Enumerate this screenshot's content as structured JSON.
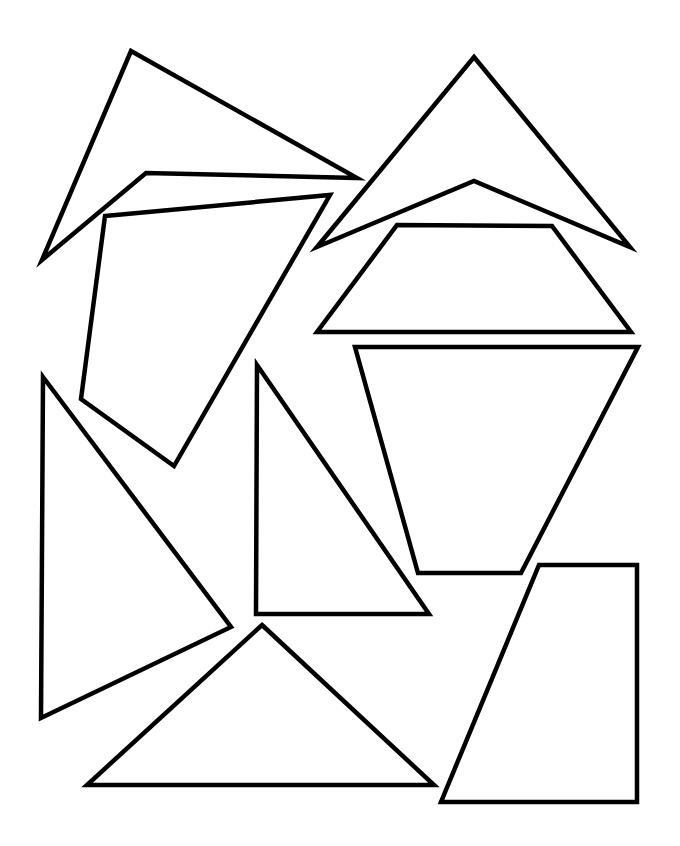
{
  "canvas": {
    "width": 680,
    "height": 846,
    "background": "#ffffff",
    "stroke_color": "#000000",
    "stroke_width": 4.5
  },
  "shapes": [
    {
      "name": "concave-kite-top-left",
      "points": "131,51 357,178 146,173 42,260"
    },
    {
      "name": "concave-kite-top-right",
      "points": "474,57 630,247 474,181 317,247"
    },
    {
      "name": "trapezoid-upper-right",
      "points": "397,225 552,226 631,332 317,332"
    },
    {
      "name": "quadrilateral-left",
      "points": "105,216 330,195 174,466 81,399"
    },
    {
      "name": "inverted-trapezoid-right",
      "points": "355,347 638,347 521,573 418,573"
    },
    {
      "name": "triangle-tall-left",
      "points": "43,377 231,627 41,718"
    },
    {
      "name": "right-triangle-center",
      "points": "257,365 429,614 256,614"
    },
    {
      "name": "triangle-bottom",
      "points": "262,625 434,785 87,785"
    },
    {
      "name": "right-trapezoid-bottom-right",
      "points": "539,565 637,565 637,802 441,802"
    }
  ]
}
